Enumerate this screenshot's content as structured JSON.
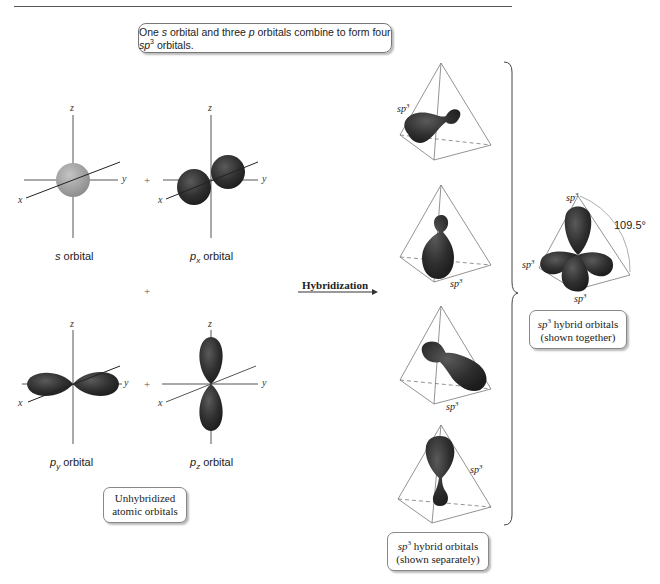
{
  "header": {
    "caption_pre": "One ",
    "caption_s": "s",
    "caption_mid": " orbital and three ",
    "caption_p": "p",
    "caption_mid2": " orbitals combine to form four ",
    "caption_sp": "sp",
    "caption_sup": "3",
    "caption_post": " orbitals."
  },
  "unhybridized": {
    "orbitals": [
      {
        "name": "s",
        "label_main": "s",
        "label_sub": "",
        "label_suffix": " orbital"
      },
      {
        "name": "px",
        "label_main": "p",
        "label_sub": "x",
        "label_suffix": " orbital"
      },
      {
        "name": "py",
        "label_main": "p",
        "label_sub": "y",
        "label_suffix": " orbital"
      },
      {
        "name": "pz",
        "label_main": "p",
        "label_sub": "z",
        "label_suffix": " orbital"
      }
    ],
    "axes": {
      "x": "x",
      "y": "y",
      "z": "z"
    },
    "plus": "+",
    "box_line1": "Unhybridized",
    "box_line2": "atomic orbitals"
  },
  "process": {
    "arrow_label": "Hybridization"
  },
  "separate": {
    "sp_label": "sp",
    "sp_sup": "3",
    "box_sp": "sp",
    "box_sup": "3",
    "box_line1_rest": " hybrid orbitals",
    "box_line2": "(shown separately)"
  },
  "together": {
    "angle": "109.5°",
    "sp_label": "sp",
    "sp_sup": "3",
    "box_sp": "sp",
    "box_sup": "3",
    "box_line1_rest": " hybrid orbitals",
    "box_line2": "(shown together)"
  },
  "colors": {
    "orbital_dark": "#2e2e2e",
    "orbital_s": "#9a9a9a",
    "line": "#555555"
  }
}
